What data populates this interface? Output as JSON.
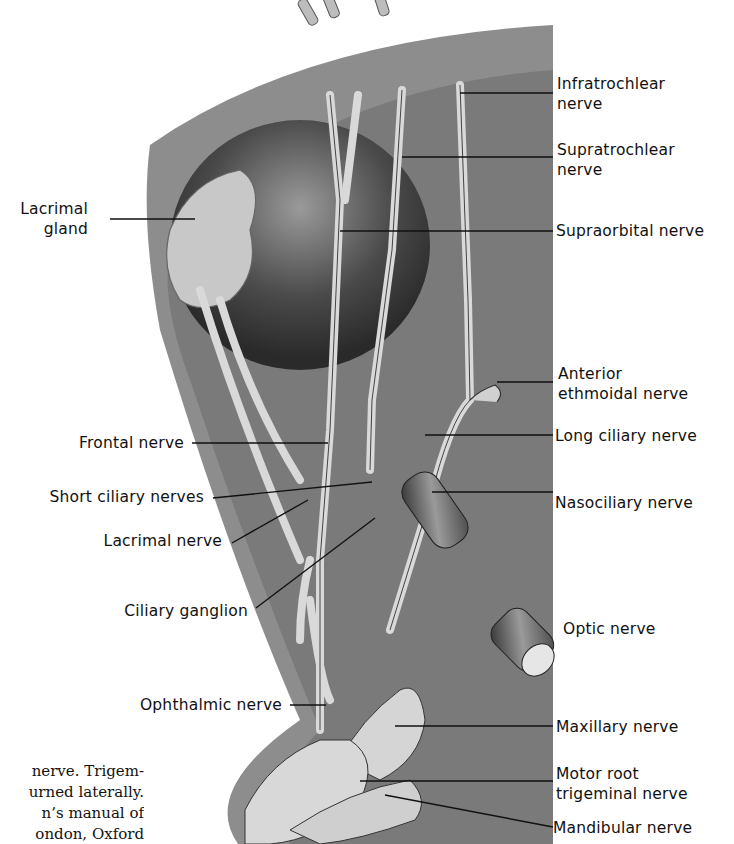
{
  "figure": {
    "labels_right": [
      {
        "id": "infratrochlear",
        "text": [
          "Infratrochlear",
          "nerve"
        ]
      },
      {
        "id": "supratrochlear",
        "text": [
          "Supratrochlear",
          "nerve"
        ]
      },
      {
        "id": "supraorbital",
        "text": [
          "Supraorbital nerve"
        ]
      },
      {
        "id": "anterior-ethmoidal",
        "text": [
          "Anterior",
          "ethmoidal nerve"
        ]
      },
      {
        "id": "long-ciliary",
        "text": [
          "Long ciliary nerve"
        ]
      },
      {
        "id": "nasociliary",
        "text": [
          "Nasociliary nerve"
        ]
      },
      {
        "id": "optic",
        "text": [
          "Optic nerve"
        ]
      },
      {
        "id": "maxillary",
        "text": [
          "Maxillary nerve"
        ]
      },
      {
        "id": "motor-root",
        "text": [
          "Motor root",
          "trigeminal nerve"
        ]
      },
      {
        "id": "mandibular",
        "text": [
          "Mandibular nerve"
        ]
      }
    ],
    "labels_left": [
      {
        "id": "lacrimal-gland",
        "text": [
          "Lacrimal",
          "gland"
        ]
      },
      {
        "id": "frontal",
        "text": [
          "Frontal nerve"
        ]
      },
      {
        "id": "short-ciliary",
        "text": [
          "Short ciliary nerves"
        ]
      },
      {
        "id": "lacrimal-nerve",
        "text": [
          "Lacrimal nerve"
        ]
      },
      {
        "id": "ciliary-ganglion",
        "text": [
          "Ciliary ganglion"
        ]
      },
      {
        "id": "ophthalmic",
        "text": [
          "Ophthalmic nerve"
        ]
      }
    ]
  },
  "caption": {
    "lines": [
      "nerve. Trigem-",
      "urned laterally.",
      "n’s manual of",
      "ondon, Oxford"
    ]
  }
}
